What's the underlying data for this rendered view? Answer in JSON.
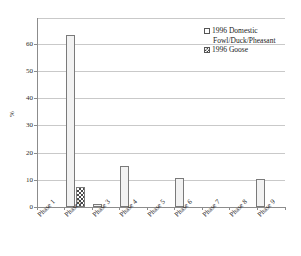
{
  "chart_data": {
    "type": "bar",
    "title": "",
    "xlabel": "",
    "ylabel": "%",
    "ylim": [
      0,
      65
    ],
    "yticks": [
      0,
      10,
      20,
      30,
      40,
      50,
      60
    ],
    "grid": true,
    "legend_position": "top-right",
    "categories": [
      "Phase 1",
      "Phase 2",
      "Phase 3",
      "Phase 4",
      "Phase 5",
      "Phase 6",
      "Phase 7",
      "Phase 8",
      "Phase 9"
    ],
    "series": [
      {
        "name": "1996 Domestic Fowl/Duck/Pheasant",
        "name_line1": "1996 Domestic",
        "name_line2": "Fowl/Duck/Pheasant",
        "swatch": "open-square",
        "values": [
          0,
          59,
          1.2,
          14,
          0,
          10,
          0,
          0,
          9.5
        ]
      },
      {
        "name": "1996 Goose",
        "swatch": "checkered-square",
        "values": [
          0,
          7,
          0,
          0,
          0,
          0,
          0,
          0,
          0
        ]
      }
    ]
  },
  "colors": {
    "axis": "#8c8c8c",
    "grid": "#c9c9c9",
    "bar_domestic": "#f2f2f2",
    "bar_goose_hatch": "#4a4a4a",
    "text": "#1a1a1a"
  }
}
